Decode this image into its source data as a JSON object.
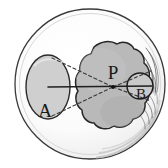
{
  "figure": {
    "background_color": "#ffffff",
    "outline_color": "#2b2b2b",
    "fill_light": "#fdfdfd",
    "fill_mid": "#cfcfcf",
    "fill_blob": "#b9b9b9",
    "fill_inner": "#c9c9c9",
    "dash_color": "#3a3a3a",
    "axis_color": "#1f1f1f"
  },
  "labels": {
    "a": "A",
    "p": "P",
    "b": "B"
  },
  "shapes": {
    "outer_circle": {
      "name": "outer-circle",
      "cx": 90,
      "cy": 84,
      "r": 76
    },
    "ellipse_a": {
      "name": "ellipse-a",
      "cx": 48,
      "cy": 87,
      "rx": 22,
      "ry": 32
    },
    "blob_p": {
      "name": "blob-p",
      "cx": 112,
      "cy": 88
    },
    "circle_b": {
      "name": "circle-b",
      "cx": 140,
      "cy": 86,
      "r": 13
    },
    "point_p": {
      "name": "point-p",
      "x": 113,
      "y": 87
    }
  },
  "lines": {
    "axis": {
      "x1": 48,
      "y1": 87,
      "x2": 152,
      "y2": 86
    },
    "tangent_upper": {
      "x1": 52,
      "y1": 58,
      "x2": 113,
      "y2": 87
    },
    "tangent_lower": {
      "x1": 52,
      "y1": 116,
      "x2": 113,
      "y2": 87
    },
    "ray_upper_right": {
      "x1": 113,
      "y1": 87,
      "x2": 150,
      "y2": 71
    },
    "ray_lower_right": {
      "x1": 113,
      "y1": 87,
      "x2": 150,
      "y2": 101
    }
  }
}
